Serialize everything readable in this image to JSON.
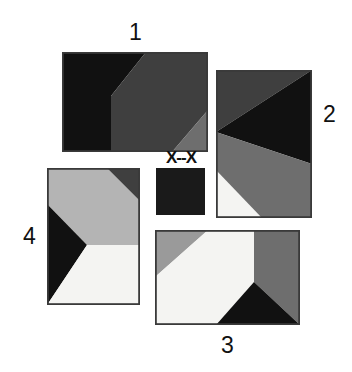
{
  "figure": {
    "background": "#ffffff",
    "width": 352,
    "height": 372,
    "kind": "geometric-tile-figure"
  },
  "palette": {
    "black": "#111111",
    "near_black": "#1a1a1a",
    "dark_gray": "#3f3f3f",
    "mid_gray": "#6e6e6e",
    "light_gray": "#b4b4b4",
    "pale_gray": "#c8c8c8",
    "white": "#f4f4f2",
    "border": "#3a3a3a"
  },
  "panels": [
    {
      "id": "panel-1",
      "label": "1",
      "label_position": "top",
      "x": 62,
      "y": 52,
      "w": 146,
      "h": 100,
      "regions": [
        {
          "name": "left-light-wedge",
          "color": "#b4b4b4",
          "points": "0,0 0,100 49,100 49,44"
        },
        {
          "name": "top-black-triangle",
          "color": "#111111",
          "points": "0,0 84,0 49,44 49,100 0,100"
        },
        {
          "name": "main-dark-region",
          "color": "#3f3f3f",
          "points": "84,0 146,0 146,58 110,100 49,100 49,44"
        },
        {
          "name": "bottom-right-gray",
          "color": "#6e6e6e",
          "points": "146,58 146,100 110,100"
        }
      ]
    },
    {
      "id": "panel-2",
      "label": "2",
      "label_position": "right",
      "x": 216,
      "y": 70,
      "w": 96,
      "h": 148,
      "regions": [
        {
          "name": "top-dark-block",
          "color": "#3f3f3f",
          "points": "0,0 96,0 0,62"
        },
        {
          "name": "right-black-wedge",
          "color": "#111111",
          "points": "96,0 96,94 0,62"
        },
        {
          "name": "body-mid-gray",
          "color": "#6e6e6e",
          "points": "0,62 96,94 96,148 0,148"
        },
        {
          "name": "bottom-left-white",
          "color": "#f4f4f2",
          "points": "0,100 46,148 0,148"
        }
      ]
    },
    {
      "id": "panel-3",
      "label": "3",
      "label_position": "bottom",
      "x": 155,
      "y": 230,
      "w": 145,
      "h": 95,
      "regions": [
        {
          "name": "top-left-gray-triangle",
          "color": "#9a9a9a",
          "points": "0,0 53,0 0,47"
        },
        {
          "name": "main-white-region",
          "color": "#f4f4f2",
          "points": "53,0 99,0 99,52 61,95 0,95 0,47"
        },
        {
          "name": "right-mid-gray-column",
          "color": "#6e6e6e",
          "points": "99,0 145,0 145,95 99,52"
        },
        {
          "name": "bottom-black-triangle",
          "color": "#111111",
          "points": "99,52 145,95 61,95"
        }
      ]
    },
    {
      "id": "panel-4",
      "label": "4",
      "label_position": "left",
      "x": 47,
      "y": 168,
      "w": 93,
      "h": 137,
      "regions": [
        {
          "name": "light-diagonal-band",
          "color": "#b4b4b4",
          "points": "0,0 60,0 93,33 93,77 40,77 0,36"
        },
        {
          "name": "top-right-dark",
          "color": "#3f3f3f",
          "points": "60,0 93,0 93,33"
        },
        {
          "name": "left-black-wedge",
          "color": "#111111",
          "points": "0,36 40,77 0,137"
        },
        {
          "name": "bottom-right-white",
          "color": "#f4f4f2",
          "points": "40,77 93,77 93,137 0,137"
        }
      ]
    }
  ],
  "center_tile": {
    "id": "center-tile",
    "label": "X--X",
    "label_position": "top",
    "x": 156,
    "y": 168,
    "w": 49,
    "h": 47,
    "color": "#1a1a1a"
  }
}
